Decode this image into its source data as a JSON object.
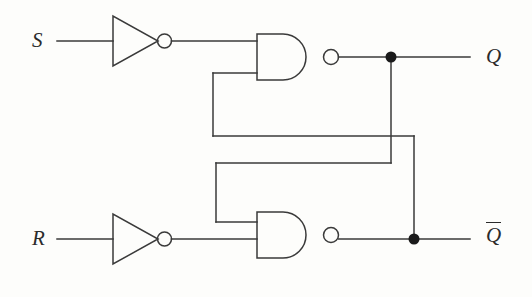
{
  "figure": {
    "kind": "logic-circuit-diagram",
    "name": "SR latch built from two inverters and two cross-coupled NAND gates",
    "background_color": "#fdfdfb",
    "line_color": "#3a3a3a",
    "label_color": "#2b2b2b",
    "width": 532,
    "height": 297
  },
  "labels": {
    "input_s": "S",
    "input_r": "R",
    "output_q": "Q",
    "output_qbar": "Q"
  },
  "gates": [
    {
      "id": "inverter-s",
      "type": "inverter",
      "inverted_output": true,
      "input_label": "S",
      "x": 113,
      "y": 41
    },
    {
      "id": "inverter-r",
      "type": "inverter",
      "inverted_output": true,
      "input_label": "R",
      "x": 113,
      "y": 239
    },
    {
      "id": "nand-top",
      "type": "nand",
      "inputs": 2,
      "inverted_output": true,
      "output_label": "Q",
      "x": 257,
      "y": 57
    },
    {
      "id": "nand-bottom",
      "type": "nand",
      "inputs": 2,
      "inverted_output": true,
      "output_label": "Q",
      "x": 257,
      "y": 239
    }
  ],
  "junctions": [
    {
      "id": "q-node",
      "x": 391,
      "y": 57
    },
    {
      "id": "qbar-node",
      "x": 414,
      "y": 239
    }
  ],
  "connections": [
    {
      "from": "S",
      "to": "inverter-s"
    },
    {
      "from": "inverter-s",
      "to": "nand-top.input-1"
    },
    {
      "from": "R",
      "to": "inverter-r"
    },
    {
      "from": "inverter-r",
      "to": "nand-bottom.input-2"
    },
    {
      "from": "nand-top.output",
      "to": "Q"
    },
    {
      "from": "nand-bottom.output",
      "to": "Qbar"
    },
    {
      "from": "qbar-node",
      "to": "nand-top.input-2"
    },
    {
      "from": "q-node",
      "to": "nand-bottom.input-1"
    }
  ]
}
